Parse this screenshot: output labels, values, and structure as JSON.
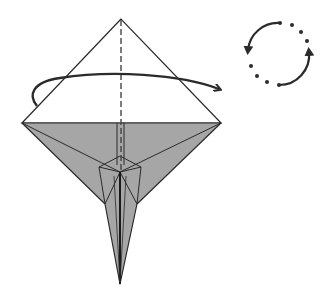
{
  "diagram": {
    "title": "Origami step: turn over",
    "kind": "origami-fold-diagram",
    "colors": {
      "paper_front": "#ffffff",
      "paper_back": "#a6a6a6",
      "line": "#2b2b2b",
      "crease": "#444444",
      "arrow": "#2b2b2b"
    },
    "model": {
      "apex": [
        121,
        19
      ],
      "left_corner": [
        22,
        123
      ],
      "right_corner": [
        221,
        123
      ],
      "center": [
        120,
        172
      ],
      "tip": [
        120,
        284
      ]
    },
    "annotations": [
      {
        "name": "valley-fold-line",
        "description": "Vertical dashed center crease"
      },
      {
        "name": "fold-behind-arrow",
        "description": "Curved arrow wrapping from left over to the right"
      },
      {
        "name": "turn-over-symbol",
        "description": "Circular arrows with dots indicating turn model over"
      }
    ]
  }
}
